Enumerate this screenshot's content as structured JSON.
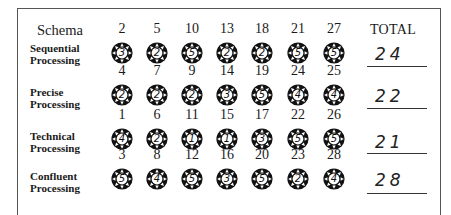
{
  "header": {
    "schema_label": "Schema",
    "total_label": "TOTAL"
  },
  "rows": [
    {
      "label_line1": "Sequential",
      "label_line2": "Processing",
      "items": [
        {
          "number": "2",
          "score": "3"
        },
        {
          "number": "5",
          "score": "2"
        },
        {
          "number": "10",
          "score": "5"
        },
        {
          "number": "13",
          "score": "2"
        },
        {
          "number": "18",
          "score": "2"
        },
        {
          "number": "21",
          "score": "5"
        },
        {
          "number": "27",
          "score": "5"
        }
      ],
      "total": "24"
    },
    {
      "label_line1": "Precise",
      "label_line2": "Processing",
      "items": [
        {
          "number": "4",
          "score": "2"
        },
        {
          "number": "7",
          "score": "2"
        },
        {
          "number": "9",
          "score": "2"
        },
        {
          "number": "14",
          "score": "3"
        },
        {
          "number": "19",
          "score": "5"
        },
        {
          "number": "24",
          "score": "4"
        },
        {
          "number": "25",
          "score": "4"
        }
      ],
      "total": "22"
    },
    {
      "label_line1": "Technical",
      "label_line2": "Processing",
      "items": [
        {
          "number": "1",
          "score": "4"
        },
        {
          "number": "6",
          "score": "2"
        },
        {
          "number": "11",
          "score": "1"
        },
        {
          "number": "15",
          "score": "1"
        },
        {
          "number": "17",
          "score": "3"
        },
        {
          "number": "22",
          "score": "5"
        },
        {
          "number": "26",
          "score": "5"
        }
      ],
      "total": "21"
    },
    {
      "label_line1": "Confluent",
      "label_line2": "Processing",
      "items": [
        {
          "number": "3",
          "score": "5"
        },
        {
          "number": "8",
          "score": "4"
        },
        {
          "number": "12",
          "score": "5"
        },
        {
          "number": "16",
          "score": "3"
        },
        {
          "number": "20",
          "score": "5"
        },
        {
          "number": "23",
          "score": "2"
        },
        {
          "number": "28",
          "score": "4"
        }
      ],
      "total": "28"
    }
  ],
  "icons": {
    "score_marker": "sun-icon"
  }
}
